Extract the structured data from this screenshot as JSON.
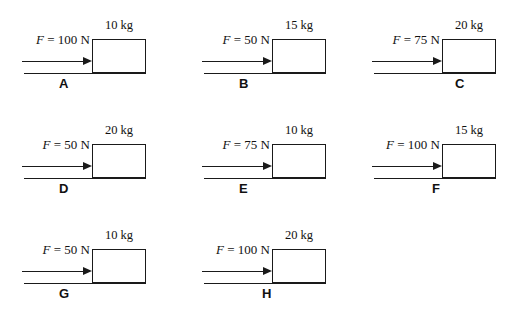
{
  "figure": {
    "units": {
      "force": "N",
      "mass": "kg"
    },
    "colors": {
      "ink": "#1a1a1a",
      "background": "#ffffff"
    },
    "panels": [
      {
        "letter": "A",
        "force_text": "F = 100 N",
        "force_symbol": "F",
        "force_rest": "= 100 N",
        "force_value": 100,
        "mass_text": "10 kg",
        "mass_value": 10,
        "letter_align": "left"
      },
      {
        "letter": "B",
        "force_text": "F = 50 N",
        "force_symbol": "F",
        "force_rest": "= 50 N",
        "force_value": 50,
        "mass_text": "15 kg",
        "mass_value": 15,
        "letter_align": "left"
      },
      {
        "letter": "C",
        "force_text": "F = 75 N",
        "force_symbol": "F",
        "force_rest": "= 75 N",
        "force_value": 75,
        "mass_text": "20 kg",
        "mass_value": 20,
        "letter_align": "center"
      },
      {
        "letter": "D",
        "force_text": "F = 50 N",
        "force_symbol": "F",
        "force_rest": "= 50 N",
        "force_value": 50,
        "mass_text": "20 kg",
        "mass_value": 20,
        "letter_align": "left"
      },
      {
        "letter": "E",
        "force_text": "F = 75 N",
        "force_symbol": "F",
        "force_rest": "= 75 N",
        "force_value": 75,
        "mass_text": "10 kg",
        "mass_value": 10,
        "letter_align": "left"
      },
      {
        "letter": "F",
        "force_text": "F = 100 N",
        "force_symbol": "F",
        "force_rest": "= 100 N",
        "force_value": 100,
        "mass_text": "15 kg",
        "mass_value": 15,
        "letter_align": "mid"
      },
      {
        "letter": "G",
        "force_text": "F = 50 N",
        "force_symbol": "F",
        "force_rest": "= 50 N",
        "force_value": 50,
        "mass_text": "10 kg",
        "mass_value": 10,
        "letter_align": "left"
      },
      {
        "letter": "H",
        "force_text": "F = 100 N",
        "force_symbol": "F",
        "force_rest": "= 100 N",
        "force_value": 100,
        "mass_text": "20 kg",
        "mass_value": 20,
        "letter_align": "mid"
      }
    ]
  }
}
